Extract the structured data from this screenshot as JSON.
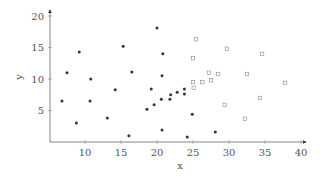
{
  "chart_data": {
    "type": "scatter",
    "title": "",
    "xlabel": "x",
    "ylabel": "y",
    "xlim": [
      5,
      41
    ],
    "ylim": [
      0,
      21
    ],
    "xticks": [
      10,
      15,
      20,
      25,
      30,
      35,
      40
    ],
    "yticks": [
      5,
      10,
      15,
      20
    ],
    "grid": false,
    "legend": null,
    "series": [
      {
        "name": "class 1",
        "marker": "filled-circle",
        "color": "#333333",
        "points": [
          [
            6.8,
            6.5
          ],
          [
            7.5,
            11.0
          ],
          [
            8.8,
            3.0
          ],
          [
            9.2,
            14.3
          ],
          [
            10.7,
            6.5
          ],
          [
            10.8,
            10.0
          ],
          [
            13.1,
            3.8
          ],
          [
            14.2,
            8.3
          ],
          [
            15.3,
            15.2
          ],
          [
            16.1,
            1.0
          ],
          [
            16.5,
            11.1
          ],
          [
            18.6,
            5.2
          ],
          [
            19.2,
            8.4
          ],
          [
            19.6,
            5.9
          ],
          [
            20.0,
            18.1
          ],
          [
            20.6,
            6.8
          ],
          [
            20.7,
            10.5
          ],
          [
            20.7,
            1.9
          ],
          [
            20.8,
            14.0
          ],
          [
            21.8,
            6.8
          ],
          [
            21.9,
            7.5
          ],
          [
            22.8,
            7.9
          ],
          [
            23.8,
            7.6
          ],
          [
            23.8,
            8.4
          ],
          [
            24.2,
            0.8
          ],
          [
            24.9,
            4.4
          ],
          [
            28.1,
            1.6
          ]
        ]
      },
      {
        "name": "class 2",
        "marker": "open-square",
        "color": "#888888",
        "points": [
          [
            25.0,
            13.3
          ],
          [
            25.0,
            9.5
          ],
          [
            25.1,
            8.6
          ],
          [
            25.4,
            16.3
          ],
          [
            26.3,
            9.5
          ],
          [
            27.2,
            11.0
          ],
          [
            27.5,
            9.8
          ],
          [
            28.5,
            10.8
          ],
          [
            29.4,
            5.9
          ],
          [
            29.7,
            14.8
          ],
          [
            32.2,
            3.7
          ],
          [
            32.5,
            10.8
          ],
          [
            34.3,
            7.0
          ],
          [
            34.6,
            14.0
          ],
          [
            37.8,
            9.4
          ]
        ]
      }
    ]
  },
  "axes": {
    "x_label": "x",
    "y_label": "y"
  }
}
